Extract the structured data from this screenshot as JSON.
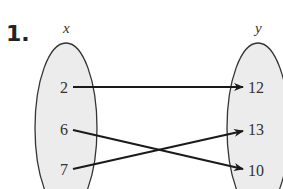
{
  "problem_number": "1.",
  "domain_set": {
    "label": "x",
    "values": [
      "2",
      "6",
      "7"
    ]
  },
  "range_set": {
    "label": "y",
    "values": [
      "12",
      "13",
      "10"
    ]
  },
  "mappings": [
    {
      "from": "2",
      "to": "12"
    },
    {
      "from": "6",
      "to": "10"
    },
    {
      "from": "7",
      "to": "13"
    }
  ],
  "colors": {
    "ellipse_fill": "#ececec",
    "ellipse_stroke": "#333333",
    "arrow": "#1a1a1a"
  }
}
